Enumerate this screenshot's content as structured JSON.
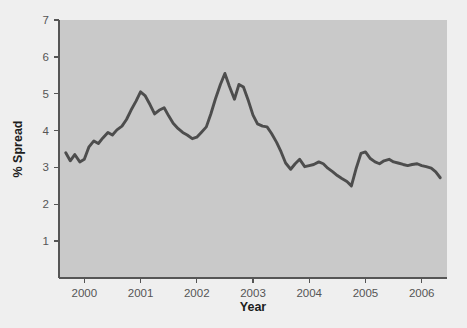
{
  "chart_data": {
    "type": "line",
    "title": "",
    "xlabel": "Year",
    "ylabel": "% Spread",
    "xlim": [
      1999.55,
      2006.45
    ],
    "ylim": [
      0,
      7
    ],
    "grid": false,
    "legend": false,
    "x_ticks": [
      2000,
      2001,
      2002,
      2003,
      2004,
      2005,
      2006
    ],
    "x_tick_labels": [
      "2000",
      "2001",
      "2002",
      "2003",
      "2004",
      "2005",
      "2006"
    ],
    "y_ticks": [
      1,
      2,
      3,
      4,
      5,
      6,
      7
    ],
    "y_tick_labels": [
      "1",
      "2",
      "3",
      "4",
      "5",
      "6",
      "7"
    ],
    "line_color": "#4d4d4d",
    "plot_background_color": "#c9c9c9",
    "figure_background_color": "#efefef",
    "series": [
      {
        "name": "% Spread",
        "x": [
          1999.67,
          1999.75,
          1999.83,
          1999.92,
          2000.0,
          2000.08,
          2000.17,
          2000.25,
          2000.33,
          2000.42,
          2000.5,
          2000.58,
          2000.67,
          2000.75,
          2000.83,
          2000.92,
          2001.0,
          2001.08,
          2001.17,
          2001.25,
          2001.33,
          2001.42,
          2001.5,
          2001.58,
          2001.67,
          2001.75,
          2001.83,
          2001.92,
          2002.0,
          2002.08,
          2002.17,
          2002.25,
          2002.33,
          2002.42,
          2002.5,
          2002.58,
          2002.67,
          2002.75,
          2002.83,
          2002.92,
          2003.0,
          2003.08,
          2003.17,
          2003.25,
          2003.33,
          2003.42,
          2003.5,
          2003.58,
          2003.67,
          2003.75,
          2003.83,
          2003.92,
          2004.0,
          2004.08,
          2004.17,
          2004.25,
          2004.33,
          2004.42,
          2004.5,
          2004.58,
          2004.67,
          2004.75,
          2004.83,
          2004.92,
          2005.0,
          2005.08,
          2005.17,
          2005.25,
          2005.33,
          2005.42,
          2005.5,
          2005.58,
          2005.67,
          2005.75,
          2005.83,
          2005.92,
          2006.0,
          2006.08,
          2006.17,
          2006.25,
          2006.33
        ],
        "y": [
          3.4,
          3.18,
          3.35,
          3.15,
          3.22,
          3.55,
          3.72,
          3.65,
          3.8,
          3.95,
          3.88,
          4.02,
          4.12,
          4.3,
          4.55,
          4.8,
          5.05,
          4.95,
          4.7,
          4.45,
          4.55,
          4.62,
          4.4,
          4.2,
          4.05,
          3.95,
          3.88,
          3.78,
          3.82,
          3.95,
          4.1,
          4.45,
          4.85,
          5.25,
          5.55,
          5.2,
          4.85,
          5.25,
          5.18,
          4.8,
          4.42,
          4.18,
          4.12,
          4.1,
          3.92,
          3.68,
          3.42,
          3.12,
          2.95,
          3.1,
          3.22,
          3.02,
          3.05,
          3.08,
          3.15,
          3.1,
          2.98,
          2.88,
          2.78,
          2.7,
          2.62,
          2.5,
          2.95,
          3.38,
          3.42,
          3.25,
          3.15,
          3.1,
          3.18,
          3.22,
          3.15,
          3.12,
          3.08,
          3.05,
          3.08,
          3.1,
          3.05,
          3.02,
          2.98,
          2.88,
          2.72
        ]
      }
    ]
  }
}
